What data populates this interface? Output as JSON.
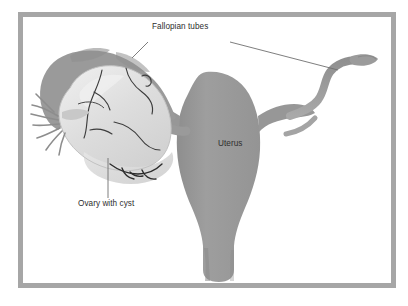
{
  "figure": {
    "copyright": "Copyright © 1989-98 by TechPool Studios, Inc. USA",
    "labels": [
      {
        "id": "fallopian",
        "text": "Fallopian tubes"
      },
      {
        "id": "uterus",
        "text": "Uterus"
      },
      {
        "id": "ovary",
        "text": "Ovary with cyst"
      }
    ],
    "colors": {
      "frame": "#a6a6a6",
      "background": "#ffffff",
      "uterus": "#9a9a9a",
      "tube_dark": "#949494",
      "tube_mid": "#a8a8a8",
      "cyst_pale": "#dedede",
      "cyst_highlight": "#ececec",
      "vessel": "#3c3c3c",
      "leader_line": "#6f6f6f",
      "label_text": "#2e2e2e"
    }
  }
}
